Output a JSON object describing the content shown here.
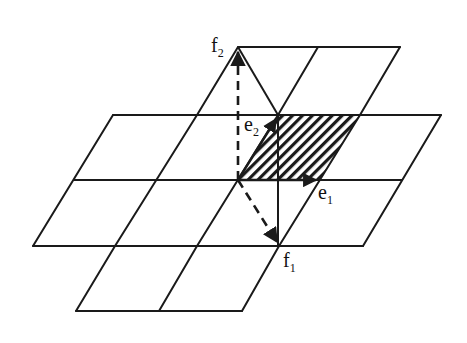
{
  "diagram": {
    "type": "lattice-basis-diagram",
    "colors": {
      "ink": "#1a1a1a",
      "background": "#ffffff"
    },
    "labels": {
      "f2": {
        "base": "f",
        "sub": "2"
      },
      "e2": {
        "base": "e",
        "sub": "2"
      },
      "e1": {
        "base": "e",
        "sub": "1"
      },
      "f1": {
        "base": "f",
        "sub": "1"
      }
    },
    "points": {
      "origin": [
        238,
        180
      ],
      "e1_tip": [
        318,
        180
      ],
      "e2_tip": [
        278,
        115
      ],
      "f1_tip": [
        279,
        246
      ],
      "f2_tip": [
        238,
        48
      ]
    },
    "shaded_cell": [
      [
        238,
        180
      ],
      [
        278,
        115
      ],
      [
        360,
        115
      ],
      [
        320,
        180
      ]
    ],
    "grid": {
      "horizontal_lines": [
        {
          "y": 47,
          "x1": 238,
          "x2": 400
        },
        {
          "y": 115,
          "x1": 113,
          "x2": 441
        },
        {
          "y": 180,
          "x1": 74,
          "x2": 402
        },
        {
          "y": 246,
          "x1": 33,
          "x2": 363
        },
        {
          "y": 311,
          "x1": 76,
          "x2": 242
        }
      ],
      "slanted_lines": [
        {
          "from": [
            238,
            47
          ],
          "to": [
            197,
            115
          ]
        },
        {
          "from": [
            318,
            47
          ],
          "to": [
            278,
            115
          ]
        },
        {
          "from": [
            400,
            47
          ],
          "to": [
            360,
            115
          ]
        },
        {
          "from": [
            113,
            115
          ],
          "to": [
            33,
            246
          ]
        },
        {
          "from": [
            197,
            115
          ],
          "to": [
            115,
            246
          ]
        },
        {
          "from": [
            278,
            115
          ],
          "to": [
            197,
            246
          ]
        },
        {
          "from": [
            360,
            115
          ],
          "to": [
            279,
            246
          ]
        },
        {
          "from": [
            441,
            115
          ],
          "to": [
            363,
            246
          ]
        },
        {
          "from": [
            115,
            246
          ],
          "to": [
            76,
            311
          ]
        },
        {
          "from": [
            197,
            246
          ],
          "to": [
            159,
            311
          ]
        },
        {
          "from": [
            279,
            246
          ],
          "to": [
            242,
            311
          ]
        }
      ],
      "extra_lines": [
        {
          "from": [
            238,
            47
          ],
          "to": [
            278,
            115
          ],
          "style": "solid"
        },
        {
          "from": [
            278,
            115
          ],
          "to": [
            278,
            246
          ],
          "style": "solid"
        }
      ]
    }
  }
}
